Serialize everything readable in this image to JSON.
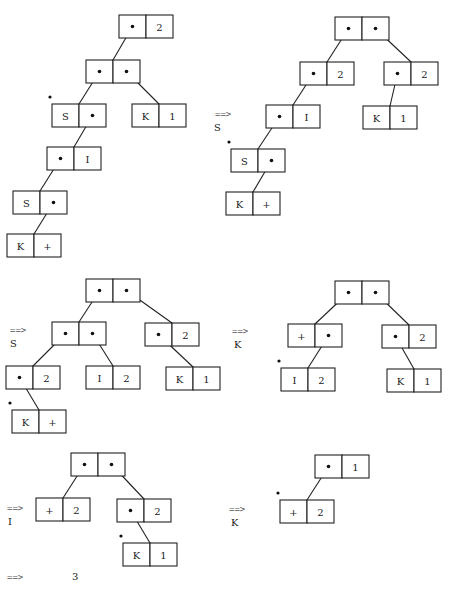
{
  "box": {
    "w": 54,
    "h": 23
  },
  "steps": [
    {
      "id": "step-0",
      "arrow": null,
      "rule": null,
      "nodes": [
        {
          "id": "n0",
          "x": 119,
          "y": 15,
          "left": null,
          "right": "2"
        },
        {
          "id": "n1",
          "x": 86,
          "y": 60,
          "left": null,
          "right": null
        },
        {
          "id": "n2",
          "x": 52,
          "y": 104,
          "left": "S",
          "right": null,
          "marked": true
        },
        {
          "id": "n3",
          "x": 132,
          "y": 104,
          "left": "K",
          "right": "1"
        },
        {
          "id": "n4",
          "x": 47,
          "y": 147,
          "left": null,
          "right": "I"
        },
        {
          "id": "n5",
          "x": 13,
          "y": 191,
          "left": "S",
          "right": null
        },
        {
          "id": "n6",
          "x": 7,
          "y": 234,
          "left": "K",
          "right": "+"
        }
      ],
      "edges": [
        {
          "from": "n0",
          "side": "left",
          "to": "n1"
        },
        {
          "from": "n1",
          "side": "left",
          "to": "n2"
        },
        {
          "from": "n1",
          "side": "right",
          "to": "n3"
        },
        {
          "from": "n2",
          "side": "right",
          "to": "n4"
        },
        {
          "from": "n4",
          "side": "left",
          "to": "n5"
        },
        {
          "from": "n5",
          "side": "right",
          "to": "n6"
        }
      ]
    },
    {
      "id": "step-1",
      "arrow": {
        "text": "==>",
        "x": 215,
        "y": 117
      },
      "rule": {
        "text": "S",
        "x": 214,
        "y": 131
      },
      "nodes": [
        {
          "id": "m0",
          "x": 335,
          "y": 17,
          "left": null,
          "right": null
        },
        {
          "id": "m1",
          "x": 300,
          "y": 62,
          "left": null,
          "right": "2"
        },
        {
          "id": "m2",
          "x": 384,
          "y": 62,
          "left": null,
          "right": "2"
        },
        {
          "id": "m3",
          "x": 266,
          "y": 105,
          "left": null,
          "right": "I"
        },
        {
          "id": "m4",
          "x": 363,
          "y": 106,
          "left": "K",
          "right": "1"
        },
        {
          "id": "m5",
          "x": 231,
          "y": 149,
          "left": "S",
          "right": null,
          "marked": true
        },
        {
          "id": "m6",
          "x": 226,
          "y": 192,
          "left": "K",
          "right": "+"
        }
      ],
      "edges": [
        {
          "from": "m0",
          "side": "left",
          "to": "m1"
        },
        {
          "from": "m0",
          "side": "right",
          "to": "m2"
        },
        {
          "from": "m1",
          "side": "left",
          "to": "m3"
        },
        {
          "from": "m2",
          "side": "left",
          "to": "m4"
        },
        {
          "from": "m3",
          "side": "left",
          "to": "m5"
        },
        {
          "from": "m5",
          "side": "right",
          "to": "m6"
        }
      ]
    },
    {
      "id": "step-2",
      "arrow": {
        "text": "==>",
        "x": 10,
        "y": 333
      },
      "rule": {
        "text": "S",
        "x": 10,
        "y": 347
      },
      "nodes": [
        {
          "id": "p0",
          "x": 86,
          "y": 279,
          "left": null,
          "right": null
        },
        {
          "id": "p1",
          "x": 52,
          "y": 322,
          "left": null,
          "right": null
        },
        {
          "id": "p2",
          "x": 145,
          "y": 323,
          "left": null,
          "right": "2"
        },
        {
          "id": "p3",
          "x": 6,
          "y": 366,
          "left": null,
          "right": "2"
        },
        {
          "id": "p4",
          "x": 86,
          "y": 366,
          "left": "I",
          "right": "2"
        },
        {
          "id": "p5",
          "x": 166,
          "y": 367,
          "left": "K",
          "right": "1"
        },
        {
          "id": "p6",
          "x": 12,
          "y": 410,
          "left": "K",
          "right": "+",
          "marked": true
        }
      ],
      "edges": [
        {
          "from": "p0",
          "side": "left",
          "to": "p1"
        },
        {
          "from": "p0",
          "side": "right",
          "to": "p2"
        },
        {
          "from": "p1",
          "side": "left",
          "to": "p3"
        },
        {
          "from": "p1",
          "side": "right",
          "to": "p4"
        },
        {
          "from": "p2",
          "side": "left",
          "to": "p5"
        },
        {
          "from": "p3",
          "side": "left",
          "to": "p6"
        }
      ]
    },
    {
      "id": "step-3",
      "arrow": {
        "text": "==>",
        "x": 232,
        "y": 334
      },
      "rule": {
        "text": "K",
        "x": 234,
        "y": 348
      },
      "nodes": [
        {
          "id": "q0",
          "x": 335,
          "y": 281,
          "left": null,
          "right": null
        },
        {
          "id": "q1",
          "x": 288,
          "y": 324,
          "left": "+",
          "right": null
        },
        {
          "id": "q2",
          "x": 382,
          "y": 325,
          "left": null,
          "right": "2"
        },
        {
          "id": "q3",
          "x": 281,
          "y": 368,
          "left": "I",
          "right": "2",
          "marked": true
        },
        {
          "id": "q4",
          "x": 387,
          "y": 369,
          "left": "K",
          "right": "1"
        }
      ],
      "edges": [
        {
          "from": "q0",
          "side": "left",
          "to": "q1"
        },
        {
          "from": "q0",
          "side": "right",
          "to": "q2"
        },
        {
          "from": "q1",
          "side": "right",
          "to": "q3"
        },
        {
          "from": "q2",
          "side": "left",
          "to": "q4"
        }
      ]
    },
    {
      "id": "step-4",
      "arrow": {
        "text": "==>",
        "x": 7,
        "y": 511
      },
      "rule": {
        "text": "I",
        "x": 8,
        "y": 525
      },
      "nodes": [
        {
          "id": "r0",
          "x": 71,
          "y": 453,
          "left": null,
          "right": null
        },
        {
          "id": "r1",
          "x": 36,
          "y": 498,
          "left": "+",
          "right": "2"
        },
        {
          "id": "r2",
          "x": 117,
          "y": 499,
          "left": null,
          "right": "2"
        },
        {
          "id": "r3",
          "x": 123,
          "y": 543,
          "left": "K",
          "right": "1",
          "marked": true
        }
      ],
      "edges": [
        {
          "from": "r0",
          "side": "left",
          "to": "r1"
        },
        {
          "from": "r0",
          "side": "right",
          "to": "r2"
        },
        {
          "from": "r2",
          "side": "left",
          "to": "r3"
        }
      ]
    },
    {
      "id": "step-5",
      "arrow": {
        "text": "==>",
        "x": 229,
        "y": 512
      },
      "rule": {
        "text": "K",
        "x": 231,
        "y": 526
      },
      "nodes": [
        {
          "id": "s0",
          "x": 315,
          "y": 455,
          "left": null,
          "right": "1"
        },
        {
          "id": "s1",
          "x": 280,
          "y": 500,
          "left": "+",
          "right": "2",
          "marked": true
        }
      ],
      "edges": [
        {
          "from": "s0",
          "side": "left",
          "to": "s1"
        }
      ]
    },
    {
      "id": "step-6",
      "arrow": {
        "text": "==>",
        "x": 7,
        "y": 580
      },
      "rule": null,
      "result": {
        "text": "3",
        "x": 72,
        "y": 580
      },
      "nodes": [],
      "edges": []
    }
  ]
}
